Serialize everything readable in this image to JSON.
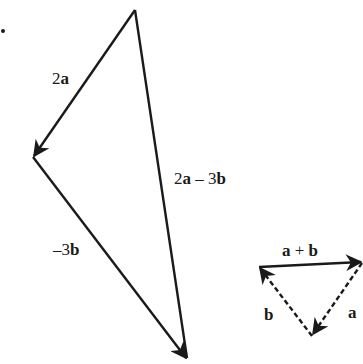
{
  "diagram": {
    "type": "vector-triangle",
    "marker_dot": ".",
    "large_triangle": {
      "vectors": [
        {
          "id": "v2a",
          "label_num": "2",
          "label_vec": "a",
          "from": [
            135,
            10
          ],
          "to": [
            33,
            157
          ],
          "style": "solid"
        },
        {
          "id": "vm3b",
          "label_num": "–3",
          "label_vec": "b",
          "from": [
            33,
            157
          ],
          "to": [
            187,
            360
          ],
          "style": "solid"
        },
        {
          "id": "v2a3b",
          "label_num": "2",
          "label_vec": "a",
          "label_op": " – 3",
          "label_vec2": "b",
          "from": [
            135,
            10
          ],
          "to": [
            187,
            360
          ],
          "style": "solid"
        }
      ]
    },
    "small_triangle": {
      "vectors": [
        {
          "id": "vab",
          "label": "a + b",
          "label_vec1": "a",
          "label_op": " + ",
          "label_vec2": "b",
          "from": [
            259,
            267
          ],
          "to": [
            362,
            262
          ],
          "style": "solid"
        },
        {
          "id": "va",
          "label_vec": "a",
          "from": [
            362,
            262
          ],
          "to": [
            312,
            336
          ],
          "style": "dashed"
        },
        {
          "id": "vb",
          "label_vec": "b",
          "from": [
            312,
            336
          ],
          "to": [
            259,
            267
          ],
          "style": "dashed"
        }
      ]
    },
    "stroke_color": "#1a1a1a"
  }
}
